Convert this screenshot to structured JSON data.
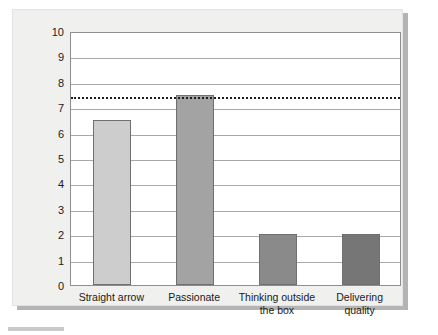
{
  "chart_data": {
    "type": "bar",
    "title": "",
    "subtitle": "",
    "xlabel": "",
    "ylabel": "",
    "categories": [
      "Straight arrow",
      "Passionate",
      "Thinking outside\nthe box",
      "Delivering\nquality"
    ],
    "values": [
      6.5,
      7.5,
      2,
      2
    ],
    "bar_colors": [
      "#cdcdcd",
      "#a3a3a3",
      "#8a8a8a",
      "#767676"
    ],
    "ylim": [
      0,
      10
    ],
    "ytick_labels": [
      "10",
      "9",
      "8",
      "7",
      "6",
      "5",
      "4",
      "3",
      "2",
      "1",
      "0"
    ],
    "ytick_values": [
      10,
      9,
      8,
      7,
      6,
      5,
      4,
      3,
      2,
      1,
      0
    ],
    "grid": true,
    "grid_axis": "y",
    "legend": false,
    "legend_position": "none",
    "annotations": [
      {
        "name": "reference-line",
        "type": "horizontal-dashed-line",
        "value": 7.5,
        "color": "#1d1d1d",
        "label": ""
      }
    ],
    "series": [
      {
        "name": "",
        "values": [
          6.5,
          7.5,
          2,
          2
        ]
      }
    ]
  },
  "panel": {
    "background_color": "#f0f0ee",
    "plot_background_color": "#ffffff"
  }
}
